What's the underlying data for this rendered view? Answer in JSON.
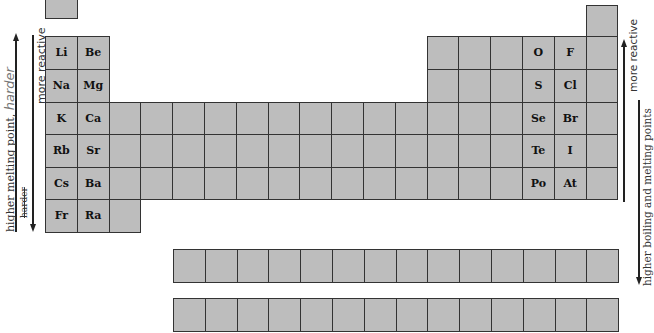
{
  "colors": {
    "cell_fill": "#bdbdbd",
    "cell_border": "#333333",
    "text": "#111111",
    "annotation": "#333333"
  },
  "table": {
    "main_cells": [
      {
        "row": 1,
        "col": 1,
        "symbol": ""
      },
      {
        "row": 1,
        "col": 18,
        "symbol": ""
      },
      {
        "row": 2,
        "col": 1,
        "symbol": "Li"
      },
      {
        "row": 2,
        "col": 2,
        "symbol": "Be"
      },
      {
        "row": 2,
        "col": 13,
        "symbol": ""
      },
      {
        "row": 2,
        "col": 14,
        "symbol": ""
      },
      {
        "row": 2,
        "col": 15,
        "symbol": ""
      },
      {
        "row": 2,
        "col": 16,
        "symbol": "O"
      },
      {
        "row": 2,
        "col": 17,
        "symbol": "F"
      },
      {
        "row": 2,
        "col": 18,
        "symbol": ""
      },
      {
        "row": 3,
        "col": 1,
        "symbol": "Na"
      },
      {
        "row": 3,
        "col": 2,
        "symbol": "Mg"
      },
      {
        "row": 3,
        "col": 13,
        "symbol": ""
      },
      {
        "row": 3,
        "col": 14,
        "symbol": ""
      },
      {
        "row": 3,
        "col": 15,
        "symbol": ""
      },
      {
        "row": 3,
        "col": 16,
        "symbol": "S"
      },
      {
        "row": 3,
        "col": 17,
        "symbol": "Cl"
      },
      {
        "row": 3,
        "col": 18,
        "symbol": ""
      },
      {
        "row": 4,
        "col": 1,
        "symbol": "K"
      },
      {
        "row": 4,
        "col": 2,
        "symbol": "Ca"
      },
      {
        "row": 4,
        "col": 16,
        "symbol": "Se"
      },
      {
        "row": 4,
        "col": 17,
        "symbol": "Br"
      },
      {
        "row": 5,
        "col": 1,
        "symbol": "Rb"
      },
      {
        "row": 5,
        "col": 2,
        "symbol": "Sr"
      },
      {
        "row": 5,
        "col": 16,
        "symbol": "Te"
      },
      {
        "row": 5,
        "col": 17,
        "symbol": "I"
      },
      {
        "row": 6,
        "col": 1,
        "symbol": "Cs"
      },
      {
        "row": 6,
        "col": 2,
        "symbol": "Ba"
      },
      {
        "row": 6,
        "col": 16,
        "symbol": "Po"
      },
      {
        "row": 6,
        "col": 17,
        "symbol": "At"
      },
      {
        "row": 7,
        "col": 1,
        "symbol": "Fr"
      },
      {
        "row": 7,
        "col": 2,
        "symbol": "Ra"
      },
      {
        "row": 7,
        "col": 3,
        "symbol": ""
      }
    ],
    "full_rows": [
      4,
      5,
      6
    ],
    "f_block_rows": 2,
    "f_block_cells_per_row": 14
  },
  "annotations": {
    "left_outer": {
      "text": "higher melting point,",
      "handwritten": "harder",
      "direction": "up"
    },
    "left_inner": {
      "text": "more reactive",
      "direction": "down",
      "crossed_out": "harder"
    },
    "right_inner": {
      "text": "more reactive",
      "direction": "up"
    },
    "right_outer": {
      "text": "higher boiling and melting points",
      "direction": "down"
    }
  }
}
